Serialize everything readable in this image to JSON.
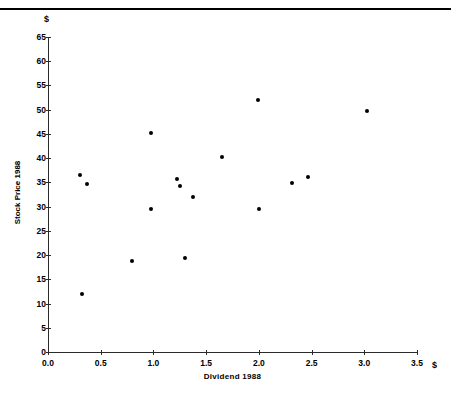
{
  "figure": {
    "top_caption": "",
    "y_unit_symbol": "$",
    "x_unit_symbol": "$"
  },
  "chart_data": {
    "type": "scatter",
    "title": "",
    "xlabel": "Dividend  1988",
    "ylabel": "Stock Price 1988",
    "xlim": [
      0.0,
      3.5
    ],
    "ylim": [
      0,
      65
    ],
    "xticks": [
      "0.0",
      "0.5",
      "1.0",
      "1.5",
      "2.0",
      "2.5",
      "3.0",
      "3.5"
    ],
    "xtick_values": [
      0.0,
      0.5,
      1.0,
      1.5,
      2.0,
      2.5,
      3.0,
      3.5
    ],
    "yticks": [
      "0",
      "5",
      "10",
      "15",
      "20",
      "25",
      "30",
      "35",
      "40",
      "45",
      "50",
      "55",
      "60",
      "65"
    ],
    "ytick_values": [
      0,
      5,
      10,
      15,
      20,
      25,
      30,
      35,
      40,
      45,
      50,
      55,
      60,
      65
    ],
    "grid": false,
    "legend": null,
    "marker": "filled-circle",
    "marker_color": "#000000",
    "points": [
      {
        "x": 0.3,
        "y": 36.5
      },
      {
        "x": 0.32,
        "y": 12.0
      },
      {
        "x": 0.37,
        "y": 34.7
      },
      {
        "x": 0.8,
        "y": 18.7
      },
      {
        "x": 0.98,
        "y": 45.2
      },
      {
        "x": 0.98,
        "y": 29.5
      },
      {
        "x": 1.22,
        "y": 35.7
      },
      {
        "x": 1.25,
        "y": 34.2
      },
      {
        "x": 1.3,
        "y": 19.5
      },
      {
        "x": 1.38,
        "y": 32.0
      },
      {
        "x": 1.65,
        "y": 40.3
      },
      {
        "x": 1.99,
        "y": 52.0
      },
      {
        "x": 2.0,
        "y": 29.5
      },
      {
        "x": 2.31,
        "y": 34.8
      },
      {
        "x": 2.47,
        "y": 36.2
      },
      {
        "x": 3.03,
        "y": 49.8
      }
    ]
  }
}
